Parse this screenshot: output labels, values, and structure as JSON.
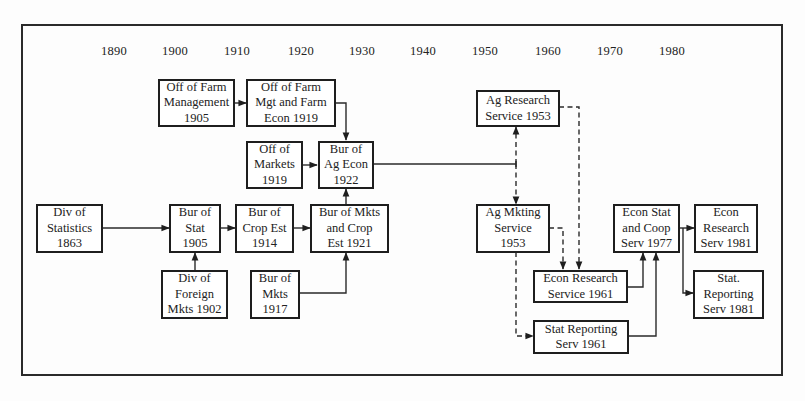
{
  "diagram": {
    "timeline_years": [
      {
        "label": "1890",
        "x": 114
      },
      {
        "label": "1900",
        "x": 175
      },
      {
        "label": "1910",
        "x": 237
      },
      {
        "label": "1920",
        "x": 301
      },
      {
        "label": "1930",
        "x": 362
      },
      {
        "label": "1940",
        "x": 423
      },
      {
        "label": "1950",
        "x": 485
      },
      {
        "label": "1960",
        "x": 548
      },
      {
        "label": "1970",
        "x": 610
      },
      {
        "label": "1980",
        "x": 672
      }
    ],
    "nodes": {
      "off_farm_mgmt": {
        "text": "Off of Farm\nManagement\n1905"
      },
      "off_farm_mgt_econ": {
        "text": "Off of Farm\nMgt and Farm\nEcon 1919"
      },
      "off_markets": {
        "text": "Off of\nMarkets\n1919"
      },
      "bur_ag_econ": {
        "text": "Bur of\nAg Econ\n1922"
      },
      "ag_research": {
        "text": "Ag Research\nService 1953"
      },
      "div_statistics": {
        "text": "Div of\nStatistics\n1863"
      },
      "bur_stat": {
        "text": "Bur of\nStat\n1905"
      },
      "bur_crop_est": {
        "text": "Bur of\nCrop Est\n1914"
      },
      "bur_mkts_crop": {
        "text": "Bur of Mkts\nand Crop\nEst 1921"
      },
      "div_foreign_mkts": {
        "text": "Div of\nForeign\nMkts 1902"
      },
      "bur_mkts": {
        "text": "Bur of\nMkts\n1917"
      },
      "ag_mkting": {
        "text": "Ag Mkting\nService\n1953"
      },
      "econ_research_1961": {
        "text": "Econ Research\nService 1961"
      },
      "stat_reporting_1961": {
        "text": "Stat Reporting\nServ 1961"
      },
      "econ_stat_coop": {
        "text": "Econ Stat\nand Coop\nServ 1977"
      },
      "econ_research_1981": {
        "text": "Econ\nResearch\nServ 1981"
      },
      "stat_reporting_1981": {
        "text": "Stat.\nReporting\nServ 1981"
      }
    },
    "edges": [
      {
        "from": "off_farm_mgmt",
        "to": "off_farm_mgt_econ",
        "style": "solid"
      },
      {
        "from": "off_farm_mgt_econ",
        "to": "bur_ag_econ",
        "style": "solid"
      },
      {
        "from": "off_markets",
        "to": "bur_ag_econ",
        "style": "solid"
      },
      {
        "from": "bur_mkts_crop",
        "to": "bur_ag_econ",
        "style": "solid"
      },
      {
        "from": "div_statistics",
        "to": "bur_stat",
        "style": "solid"
      },
      {
        "from": "div_foreign_mkts",
        "to": "bur_stat",
        "style": "solid"
      },
      {
        "from": "bur_stat",
        "to": "bur_crop_est",
        "style": "solid"
      },
      {
        "from": "bur_crop_est",
        "to": "bur_mkts_crop",
        "style": "solid"
      },
      {
        "from": "bur_mkts",
        "to": "bur_mkts_crop",
        "style": "solid"
      },
      {
        "from": "bur_ag_econ",
        "to": "ag_research",
        "style": "dashed"
      },
      {
        "from": "bur_ag_econ",
        "to": "ag_mkting",
        "style": "dashed"
      },
      {
        "from": "ag_research",
        "to": "econ_research_1961",
        "style": "dashed"
      },
      {
        "from": "ag_mkting",
        "to": "econ_research_1961",
        "style": "dashed"
      },
      {
        "from": "ag_mkting",
        "to": "stat_reporting_1961",
        "style": "dashed"
      },
      {
        "from": "econ_research_1961",
        "to": "econ_stat_coop",
        "style": "solid"
      },
      {
        "from": "stat_reporting_1961",
        "to": "econ_stat_coop",
        "style": "solid"
      },
      {
        "from": "econ_stat_coop",
        "to": "econ_research_1981",
        "style": "solid"
      },
      {
        "from": "econ_stat_coop",
        "to": "stat_reporting_1981",
        "style": "solid"
      }
    ]
  }
}
